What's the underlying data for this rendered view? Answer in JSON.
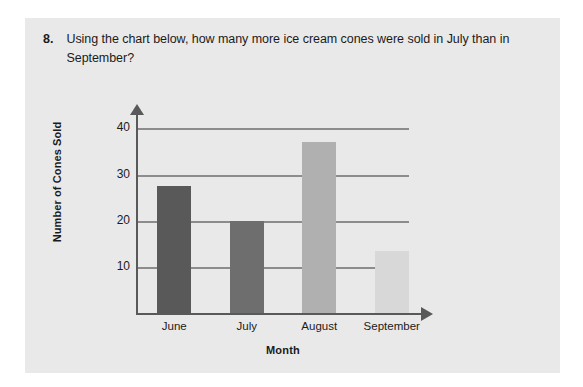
{
  "question": {
    "number": "8.",
    "text": "Using the chart below, how many more ice cream cones were sold in July than in September?"
  },
  "chart_data": {
    "type": "bar",
    "title": "",
    "categories": [
      "June",
      "July",
      "August",
      "September"
    ],
    "values": [
      27.5,
      20,
      37,
      13.5
    ],
    "xlabel": "Month",
    "ylabel": "Number of Cones Sold",
    "ylim": [
      0,
      44
    ],
    "yticks": [
      10,
      20,
      30,
      40
    ],
    "ytick_labels": [
      "10",
      "20",
      "30",
      "40"
    ],
    "grid": true,
    "legend": false,
    "bar_colors": [
      "#595959",
      "#6e6e6e",
      "#b0b0b0",
      "#d8d8d8"
    ],
    "axis_color": "#595959",
    "grid_color": "#8c8c8c",
    "panel_color": "#e9e9e9"
  }
}
